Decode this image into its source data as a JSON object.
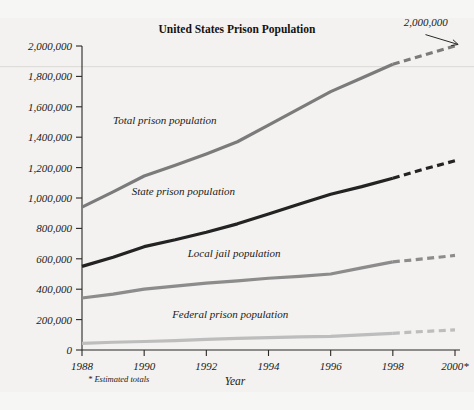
{
  "figure": {
    "title": "United States Prison Population",
    "footnote": "* Estimated totals",
    "background_color": "#f3f2f0"
  },
  "axes": {
    "x": {
      "title": "Year",
      "tick_labels": [
        "1988",
        "1990",
        "1992",
        "1994",
        "1996",
        "1998",
        "2000*"
      ],
      "tick_values": [
        1988,
        1990,
        1992,
        1994,
        1996,
        1998,
        2000
      ],
      "min": 1988,
      "max": 2000
    },
    "y": {
      "title": "",
      "tick_labels": [
        "0",
        "200,000",
        "400,000",
        "600,000",
        "800,000",
        "1,000,000",
        "1,200,000",
        "1,400,000",
        "1,600,000",
        "1,800,000",
        "2,000,000"
      ],
      "tick_values": [
        0,
        200000,
        400000,
        600000,
        800000,
        1000000,
        1200000,
        1400000,
        1600000,
        1800000,
        2000000
      ],
      "min": 0,
      "max": 2000000
    }
  },
  "annotations": [
    {
      "name": "total-2000-callout",
      "text": "2,000,000",
      "x": 1998.35,
      "y": 2130000,
      "arrow_from": [
        1999.05,
        2075000
      ],
      "arrow_to": [
        2000.1,
        2010000
      ]
    }
  ],
  "chart_data": {
    "type": "line",
    "title": "United States Prison Population",
    "xlabel": "Year",
    "ylabel": "",
    "xlim": [
      1988,
      2000
    ],
    "ylim": [
      0,
      2000000
    ],
    "grid": false,
    "legend_position": "inline-labels",
    "x": [
      1988,
      1989,
      1990,
      1991,
      1992,
      1993,
      1994,
      1995,
      1996,
      1997,
      1998,
      1999,
      2000
    ],
    "dashed_from_x": 1998,
    "series": [
      {
        "name": "Total prison population",
        "label": "Total prison population",
        "color": "#7b7b7b",
        "width": 3.2,
        "label_x": 1989.0,
        "label_y": 1490000,
        "values": [
          940000,
          1040000,
          1145000,
          1215000,
          1290000,
          1370000,
          1480000,
          1590000,
          1700000,
          1790000,
          1880000,
          1940000,
          2000000
        ]
      },
      {
        "name": "State prison population",
        "label": "State prison population",
        "color": "#232323",
        "width": 3.2,
        "label_x": 1989.6,
        "label_y": 1020000,
        "values": [
          550000,
          610000,
          680000,
          725000,
          775000,
          830000,
          895000,
          960000,
          1025000,
          1075000,
          1130000,
          1190000,
          1245000
        ]
      },
      {
        "name": "Local jail population",
        "label": "Local jail population",
        "color": "#8c8c8c",
        "width": 3.2,
        "label_x": 1991.4,
        "label_y": 612000,
        "values": [
          342000,
          368000,
          400000,
          420000,
          440000,
          455000,
          472000,
          485000,
          500000,
          540000,
          580000,
          600000,
          622000
        ]
      },
      {
        "name": "Federal prison population",
        "label": "Federal prison population",
        "color": "#bdbdbd",
        "width": 3.2,
        "label_x": 1990.9,
        "label_y": 210000,
        "values": [
          44000,
          51000,
          56000,
          62000,
          70000,
          76000,
          82000,
          86000,
          90000,
          100000,
          110000,
          122000,
          132000
        ]
      }
    ]
  }
}
